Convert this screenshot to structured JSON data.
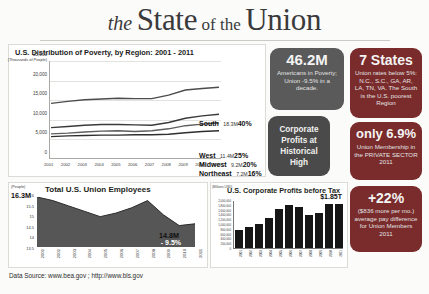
{
  "header": {
    "the": "the",
    "state": "State",
    "of_the": "of the",
    "union": "Union"
  },
  "source": {
    "text": "Data Source: www.bea.gov ; http://www.bls.gov"
  },
  "poverty_panel": {
    "title": "U.S. Distribution of Poverty, by Region: 2001 - 2011",
    "y_unit": "(Thousands of People)",
    "y_ticks": [
      "25,000",
      "20,000",
      "15,000",
      "10,000",
      "5,000",
      "0"
    ],
    "x_ticks": [
      "2001",
      "2002",
      "2003",
      "2004",
      "2005",
      "2006",
      "2007",
      "2008",
      "2009",
      "2010",
      "2011"
    ],
    "series_labels": [
      {
        "name": "South",
        "value": "18.3M",
        "pct": "40%"
      },
      {
        "name": "West",
        "value": "11.4M",
        "pct": "25%"
      },
      {
        "name": "Midwest",
        "value": "9.2M",
        "pct": "20%"
      },
      {
        "name": "Northeast",
        "value": "7.2M",
        "pct": "16%"
      }
    ]
  },
  "union_panel": {
    "title": "Total U.S. Union Employees",
    "y_unit": "(People)",
    "start_label": "16.3M",
    "end_label": "14.8M",
    "change": "- 9.5%",
    "change_span": "'01 to '11",
    "y_ticks": [
      "16",
      "15.5",
      "15",
      "14.5",
      "14",
      "13.5"
    ],
    "x_ticks": [
      "2001",
      "2002",
      "2003",
      "2004",
      "2005",
      "2006",
      "2007",
      "2008",
      "2009",
      "2010",
      "2011"
    ]
  },
  "profits_panel": {
    "title": "U.S. Corporate Profits before Tax",
    "y_unit": "(Millions USD)",
    "peak_label": "$1.85T",
    "y_ticks": [
      "2,000,000",
      "1,800,000",
      "1,600,000",
      "1,400,000",
      "1,200,000",
      "1,000,000",
      "800,000",
      "600,000",
      "400,000",
      "200,000",
      "0"
    ],
    "x_ticks": [
      "2001",
      "2002",
      "2003",
      "2004",
      "2005",
      "2006",
      "2007",
      "2008",
      "2009",
      "2010",
      "2011"
    ]
  },
  "callouts": [
    {
      "id": "poverty-count",
      "big": "46.2M",
      "sub": "Americans in Poverty;  Union -9.5% in a decade.",
      "color": "#5a5a5a"
    },
    {
      "id": "seven-states",
      "big": "7 States",
      "sub": "Union rates below 5%: N.C., S.C., GA, AR, LA, TN, VA.  The South is the U.S. poorest Region",
      "color": "#7a2b2b"
    },
    {
      "id": "corporate-profits-high",
      "big": "",
      "sub": "Corporate Profits at Historical High",
      "color": "#4a4a4a"
    },
    {
      "id": "private-sector-membership",
      "big": "only 6.9%",
      "sub": "Union Membership in the PRIVATE SECTOR 2011",
      "color": "#7a2b2b"
    },
    {
      "id": "pay-difference",
      "big": "+22%",
      "sub": "($836 more per mo.) average pay difference for Union Members 2011",
      "color": "#7a2b2b"
    }
  ],
  "chart_data": [
    {
      "type": "line",
      "id": "poverty-by-region",
      "title": "U.S. Distribution of Poverty, by Region: 2001 - 2011",
      "xlabel": "",
      "ylabel": "(Thousands of People)",
      "ylim": [
        0,
        25000
      ],
      "grid": true,
      "legend": "inline-right",
      "x": [
        "2001",
        "2002",
        "2003",
        "2004",
        "2005",
        "2006",
        "2007",
        "2008",
        "2009",
        "2010",
        "2011"
      ],
      "series": [
        {
          "name": "South",
          "values": [
            14200,
            14700,
            15100,
            15300,
            15500,
            15400,
            15400,
            16300,
            17600,
            18000,
            18300
          ],
          "share_pct": 40,
          "end_value_label": "18.3M"
        },
        {
          "name": "West",
          "values": [
            8000,
            8300,
            8600,
            8800,
            8800,
            8700,
            8600,
            9300,
            10400,
            11000,
            11400
          ],
          "share_pct": 25,
          "end_value_label": "11.4M"
        },
        {
          "name": "Midwest",
          "values": [
            6400,
            6600,
            6900,
            7100,
            7200,
            7000,
            7200,
            7700,
            8500,
            8900,
            9200
          ],
          "share_pct": 20,
          "end_value_label": "9.2M"
        },
        {
          "name": "Northeast",
          "values": [
            5700,
            5900,
            6000,
            6100,
            6100,
            6200,
            6200,
            6300,
            6700,
            7000,
            7200
          ],
          "share_pct": 16,
          "end_value_label": "7.2M"
        }
      ]
    },
    {
      "type": "area",
      "id": "total-union-employees",
      "title": "Total U.S. Union Employees",
      "xlabel": "",
      "ylabel": "(People)",
      "ylim": [
        13.5,
        16.3
      ],
      "unit": "Millions",
      "x": [
        "2001",
        "2002",
        "2003",
        "2004",
        "2005",
        "2006",
        "2007",
        "2008",
        "2009",
        "2010",
        "2011"
      ],
      "values": [
        16.3,
        16.1,
        15.8,
        15.5,
        15.2,
        15.4,
        15.7,
        16.1,
        15.3,
        14.7,
        14.8
      ],
      "annotations": [
        {
          "text": "16.3M",
          "at": "2001"
        },
        {
          "text": "14.8M",
          "at": "2011"
        },
        {
          "text": "- 9.5%",
          "at": "2011"
        },
        {
          "text": "'01 to '11",
          "at": "2011"
        }
      ]
    },
    {
      "type": "bar",
      "id": "corporate-profits-before-tax",
      "title": "U.S. Corporate Profits before Tax",
      "xlabel": "",
      "ylabel": "(Millions USD)",
      "ylim": [
        0,
        2000000
      ],
      "categories": [
        "2001",
        "2002",
        "2003",
        "2004",
        "2005",
        "2006",
        "2007",
        "2008",
        "2009",
        "2010",
        "2011"
      ],
      "values": [
        767000,
        886000,
        993000,
        1231000,
        1613000,
        1797000,
        1690000,
        1381000,
        1470000,
        1820000,
        1850000
      ],
      "annotations": [
        {
          "text": "$1.85T",
          "at": "2011"
        }
      ]
    }
  ]
}
